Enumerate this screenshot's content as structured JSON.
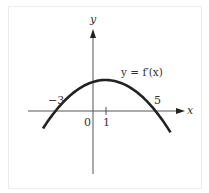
{
  "chart_data": {
    "type": "line",
    "title": "",
    "curve_label": "y = f′(x)",
    "xlabel": "x",
    "ylabel": "y",
    "origin_label": "0",
    "x_tick_labels": [
      "-3",
      "1",
      "5"
    ],
    "x_tick_values": [
      -3,
      1,
      5
    ],
    "series": [
      {
        "name": "y = f′(x)",
        "description": "downward-opening parabola with roots at x = -3 and x = 5, vertex at x = 1",
        "x": [
          -4,
          -3,
          -2,
          -1,
          0,
          1,
          2,
          3,
          4,
          5,
          6
        ],
        "values": [
          -9,
          0,
          7,
          12,
          15,
          16,
          15,
          12,
          7,
          0,
          -7
        ]
      }
    ],
    "roots": [
      -3,
      5
    ],
    "vertex_x": 1,
    "grid": false,
    "legend": "none"
  },
  "labels": {
    "y_axis": "y",
    "x_axis": "x",
    "curve": "y = f′(x)",
    "neg3": "−3",
    "zero": "0",
    "one": "1",
    "five": "5"
  }
}
